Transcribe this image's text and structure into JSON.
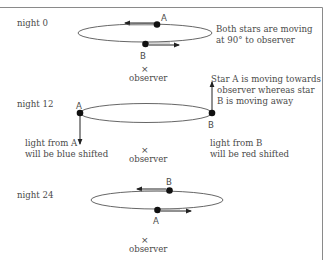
{
  "panels": [
    {
      "label": "night 0",
      "note": [
        "Both stars are moving",
        "at 90° to observer"
      ],
      "star_a": "A",
      "star_b": "B",
      "observer_mark": "×",
      "observer_label": "observer"
    },
    {
      "label": "night 12",
      "note": [
        "Star A is moving towards",
        "observer whereas star",
        "B is moving away"
      ],
      "star_a": "A",
      "star_b": "B",
      "caption_a": [
        "light from A",
        "will be blue shifted"
      ],
      "caption_b": [
        "light from B",
        "will be red shifted"
      ],
      "observer_mark": "×",
      "observer_label": "observer"
    },
    {
      "label": "night 24",
      "star_a": "A",
      "star_b": "B",
      "observer_mark": "×",
      "observer_label": "observer"
    }
  ],
  "colors": {
    "line": "#555555",
    "star": "#111111",
    "border": "#888888",
    "text": "#4a4a4a"
  }
}
